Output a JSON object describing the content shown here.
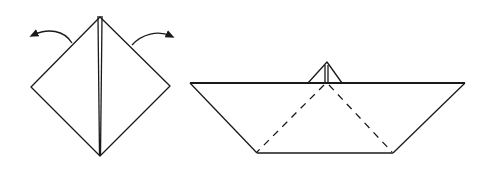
{
  "diagram": {
    "step1": {
      "shape": "diamond",
      "annotations": [
        "left-fold-arrow",
        "right-fold-arrow"
      ],
      "center_fold": true
    },
    "step2": {
      "shape": "paper-boat",
      "hidden_edges": "dashed",
      "sail": true
    },
    "colors": {
      "line": "#1a1a1a",
      "background": "#ffffff"
    }
  }
}
